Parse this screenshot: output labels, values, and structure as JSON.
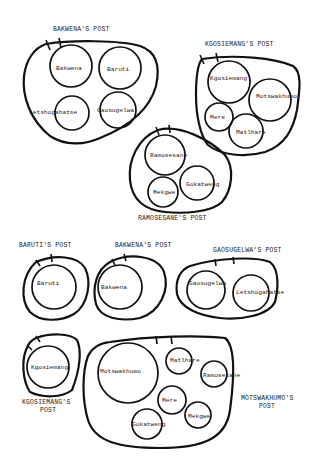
{
  "diagram": {
    "type": "venn-like group diagrams",
    "groups": [
      {
        "title": "BAKWENA'S POST",
        "members": [
          "Bakwena",
          "Baruti",
          "Letshogahatse",
          "Gaosugelwa"
        ]
      },
      {
        "title": "KGOSIEMANG'S POST",
        "members": [
          "Kgosiemang",
          "Motswakhumo",
          "Mere",
          "Matlhare"
        ]
      },
      {
        "title": "RAMOSESANE'S POST",
        "members": [
          "Ramosesane",
          "Mekgwe",
          "Gokatweng"
        ]
      },
      {
        "title": "BARUTI'S POST",
        "members": [
          "Baruti"
        ]
      },
      {
        "title": "BAKWENA'S POST",
        "members": [
          "Bakwena"
        ]
      },
      {
        "title": "GAOSUGELWA'S POST",
        "members": [
          "Gaosugelwa",
          "Letshogahatse"
        ]
      },
      {
        "title_line1": "KGOSIEMANG'S",
        "title_line2": "POST",
        "members": [
          "Kgosiemang"
        ]
      },
      {
        "title_line1": "MOTSWAKHUMO'S",
        "title_line2": "POST",
        "members": [
          "Motswakhumo",
          "Matlhare",
          "Ramosesane",
          "Mere",
          "Mekgwe",
          "Gokatweng"
        ]
      }
    ]
  }
}
